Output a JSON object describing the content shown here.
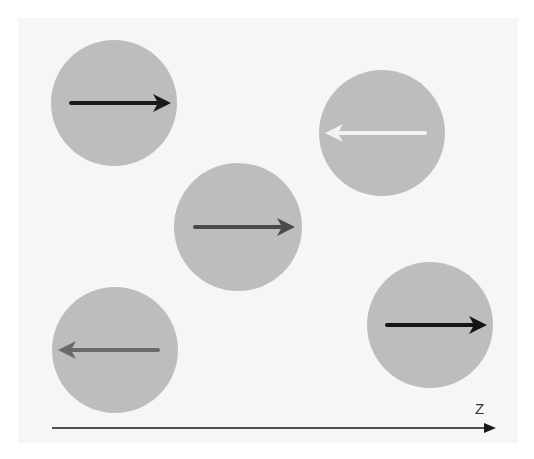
{
  "diagram": {
    "axis": {
      "label": "Z",
      "direction": "right",
      "color": "#1a1a1a"
    },
    "circle_color": "#bdbdbd",
    "particles": [
      {
        "cx": 114,
        "cy": 103,
        "r": 63,
        "arrow_direction": "right",
        "arrow_color": "#1a1a1a"
      },
      {
        "cx": 382,
        "cy": 133,
        "r": 63,
        "arrow_direction": "left",
        "arrow_color": "#f2f2f2"
      },
      {
        "cx": 238,
        "cy": 227,
        "r": 64,
        "arrow_direction": "right",
        "arrow_color": "#4a4a4a"
      },
      {
        "cx": 115,
        "cy": 350,
        "r": 63,
        "arrow_direction": "left",
        "arrow_color": "#6a6a6a"
      },
      {
        "cx": 430,
        "cy": 325,
        "r": 63,
        "arrow_direction": "right",
        "arrow_color": "#151515"
      }
    ]
  }
}
